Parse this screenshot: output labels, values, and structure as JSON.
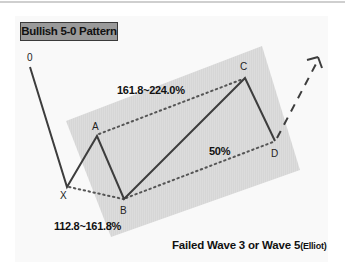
{
  "title": "Bullish 5-0 Pattern",
  "points": {
    "O": {
      "label": "0",
      "x": 30,
      "y": 67
    },
    "X": {
      "label": "X",
      "x": 67,
      "y": 187
    },
    "A": {
      "label": "A",
      "x": 97,
      "y": 136
    },
    "B": {
      "label": "B",
      "x": 124,
      "y": 199
    },
    "C": {
      "label": "C",
      "x": 245,
      "y": 78
    },
    "D": {
      "label": "D",
      "x": 275,
      "y": 141
    }
  },
  "ratios": {
    "ac": "161.8~224.0%",
    "bd": "50%",
    "xb": "112.8~161.8%"
  },
  "caption": {
    "main": "Failed Wave 3 or Wave 5",
    "suffix": "(Elliot)"
  },
  "colors": {
    "line": "#3d3d3d",
    "zone": "#d9d9d9",
    "title_bg": "#9a9a9a"
  }
}
